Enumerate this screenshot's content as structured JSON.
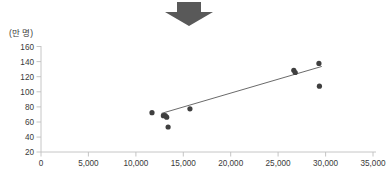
{
  "figure": {
    "unit_label": "(만 명)",
    "arrow_icon": "down-arrow-icon",
    "arrow_color": "#595959",
    "credit_text": "",
    "point_color": "#3f3f3f",
    "line_color": "#595959",
    "axis_color": "#bfbfbf"
  },
  "chart_data": {
    "type": "scatter",
    "title": "",
    "xlabel": "",
    "ylabel": "(만 명)",
    "xlim": [
      0,
      35000
    ],
    "ylim": [
      20,
      160
    ],
    "xticks": [
      0,
      5000,
      10000,
      15000,
      20000,
      25000,
      30000,
      35000
    ],
    "xticklabels": [
      "0",
      "5,000",
      "10,000",
      "15,000",
      "20,000",
      "25,000",
      "30,000",
      "35,000"
    ],
    "yticks": [
      20,
      40,
      60,
      80,
      100,
      120,
      140,
      160
    ],
    "yticklabels": [
      "20",
      "40",
      "60",
      "80",
      "100",
      "120",
      "140",
      "160"
    ],
    "grid": false,
    "legend": null,
    "series": [
      {
        "name": "points",
        "x": [
          11700,
          12900,
          13100,
          13250,
          13400,
          15700,
          26650,
          26800,
          29300,
          29350
        ],
        "y": [
          72,
          68,
          68,
          66,
          53,
          77,
          128,
          125,
          137,
          107
        ]
      }
    ],
    "trendline": {
      "type": "linear",
      "x": [
        12700,
        29600
      ],
      "y": [
        71,
        133
      ]
    }
  }
}
